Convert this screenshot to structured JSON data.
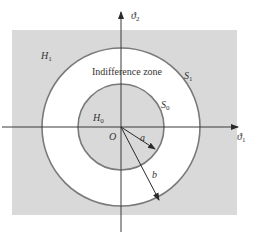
{
  "diagram": {
    "colors": {
      "region_fill": "#d9d9d9",
      "zone_fill": "#ffffff",
      "circle_stroke": "#7a7a7a",
      "axis_stroke": "#3a3a3a",
      "text": "#333333"
    },
    "axes": {
      "x_label": "ϑ",
      "x_sub": "1",
      "y_label": "ϑ",
      "y_sub": "2",
      "origin_label": "O"
    },
    "regions": {
      "outer": {
        "label": "H",
        "sub": "1"
      },
      "inner": {
        "label": "H",
        "sub": "0"
      },
      "zone": {
        "label": "Indifference zone"
      }
    },
    "boundaries": {
      "outer": {
        "label": "S",
        "sub": "1"
      },
      "inner": {
        "label": "S",
        "sub": "0"
      }
    },
    "radii": {
      "inner": {
        "label": "a"
      },
      "outer": {
        "label": "b"
      }
    }
  }
}
